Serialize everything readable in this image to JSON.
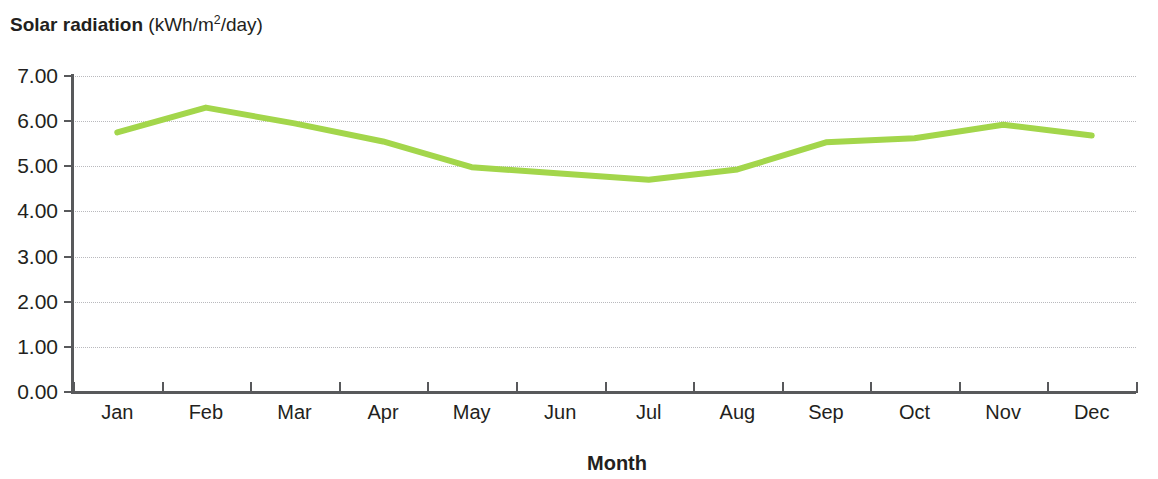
{
  "title": {
    "main": "Solar radiation",
    "unit_prefix": " (kWh/m",
    "unit_sup": "2",
    "unit_suffix": "/day)",
    "full": "Solar radiation (kWh/m2/day)"
  },
  "axis": {
    "x_title": "Month",
    "y_tick_labels": [
      "0.00",
      "1.00",
      "2.00",
      "3.00",
      "4.00",
      "5.00",
      "6.00",
      "7.00"
    ]
  },
  "colors": {
    "series_line": "#a3d64b",
    "gridline": "#b9b9bd",
    "axis": "#58595b",
    "text": "#231f20",
    "background": "#ffffff"
  },
  "chart_data": {
    "type": "line",
    "title": "Solar radiation (kWh/m2/day)",
    "xlabel": "Month",
    "ylabel": "Solar radiation (kWh/m2/day)",
    "categories": [
      "Jan",
      "Feb",
      "Mar",
      "Apr",
      "May",
      "Jun",
      "Jul",
      "Aug",
      "Sep",
      "Oct",
      "Nov",
      "Dec"
    ],
    "values": [
      5.75,
      6.3,
      5.95,
      5.55,
      4.98,
      4.84,
      4.7,
      4.93,
      5.53,
      5.62,
      5.92,
      5.68
    ],
    "series": [
      {
        "name": "Solar radiation",
        "color": "#a3d64b",
        "values": [
          5.75,
          6.3,
          5.95,
          5.55,
          4.98,
          4.84,
          4.7,
          4.93,
          5.53,
          5.62,
          5.92,
          5.68
        ]
      }
    ],
    "ylim": [
      0.0,
      7.0
    ],
    "ytick_step": 1.0,
    "grid": true,
    "grid_axis": "y",
    "grid_style": "dotted",
    "legend": false,
    "markers": false,
    "line_width_px": 6
  }
}
